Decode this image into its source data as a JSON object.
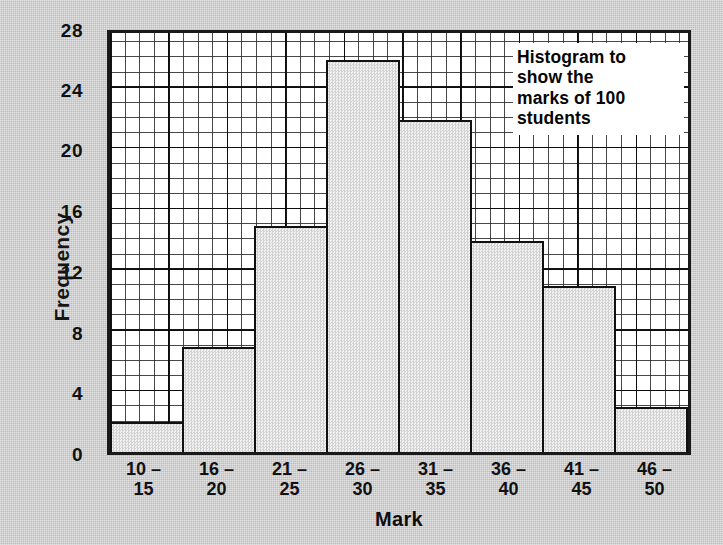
{
  "chart_data": {
    "type": "bar",
    "title": "Histogram to show the marks of 100 students",
    "title_lines": [
      "Histogram to",
      "show the",
      "marks of 100",
      "students"
    ],
    "xlabel": "Mark",
    "ylabel": "Frequency",
    "categories": [
      "10 – 15",
      "16 – 20",
      "21 – 25",
      "26 – 30",
      "31 – 35",
      "36 – 40",
      "41 – 45",
      "46 – 50"
    ],
    "category_lines": [
      {
        "top": "10 –",
        "bottom": "15"
      },
      {
        "top": "16 –",
        "bottom": "20"
      },
      {
        "top": "21 –",
        "bottom": "25"
      },
      {
        "top": "26 –",
        "bottom": "30"
      },
      {
        "top": "31 –",
        "bottom": "35"
      },
      {
        "top": "36 –",
        "bottom": "40"
      },
      {
        "top": "41 –",
        "bottom": "45"
      },
      {
        "top": "46 –",
        "bottom": "50"
      }
    ],
    "values": [
      2,
      7,
      15,
      26,
      22,
      14,
      11,
      3
    ],
    "ylim": [
      0,
      28
    ],
    "ytick_labels": [
      "0",
      "4",
      "8",
      "12",
      "16",
      "20",
      "24",
      "28"
    ],
    "ytick_values": [
      0,
      4,
      8,
      12,
      16,
      20,
      24,
      28
    ],
    "grid": "on",
    "grid_minor_step": 1,
    "grid_major_step": 4,
    "legend": "none",
    "total": 100,
    "colors": {
      "background": "#c9c9c9",
      "plot_background": "#ffffff",
      "bar_fill": "#e4e4e4",
      "bar_edge": "#111111",
      "grid": "#2a2a2a",
      "text": "#111111"
    }
  }
}
